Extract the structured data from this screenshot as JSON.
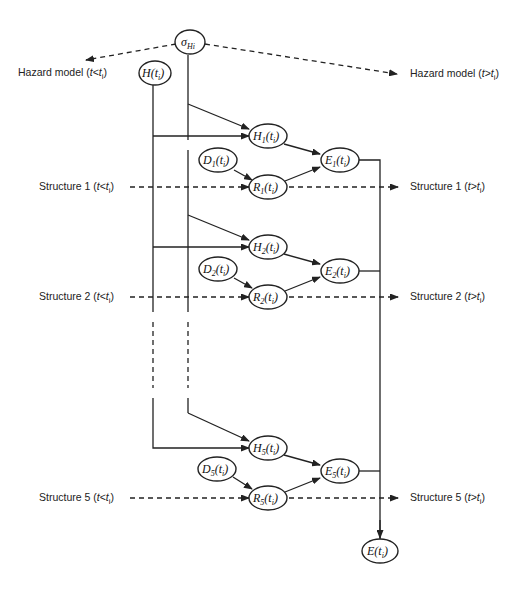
{
  "diagram": {
    "nodes": {
      "sigma": {
        "base": "σ",
        "sub": "Hi",
        "suffix": ""
      },
      "H": {
        "base": "H(t",
        "sub": "i",
        "suffix": ")"
      },
      "H1": {
        "base": "H",
        "sub": "1",
        "suffix": "(t",
        "sub2": "i",
        "suffix2": ")"
      },
      "D1": {
        "base": "D",
        "sub": "1",
        "suffix": "(t",
        "sub2": "i",
        "suffix2": ")"
      },
      "R1": {
        "base": "R",
        "sub": "1",
        "suffix": "(t",
        "sub2": "i",
        "suffix2": ")"
      },
      "E1": {
        "base": "E",
        "sub": "1",
        "suffix": "(t",
        "sub2": "i",
        "suffix2": ")"
      },
      "H2": {
        "base": "H",
        "sub": "2",
        "suffix": "(t",
        "sub2": "i",
        "suffix2": ")"
      },
      "D2": {
        "base": "D",
        "sub": "2",
        "suffix": "(t",
        "sub2": "i",
        "suffix2": ")"
      },
      "R2": {
        "base": "R",
        "sub": "2",
        "suffix": "(t",
        "sub2": "i",
        "suffix2": ")"
      },
      "E2": {
        "base": "E",
        "sub": "2",
        "suffix": "(t",
        "sub2": "i",
        "suffix2": ")"
      },
      "H5": {
        "base": "H",
        "sub": "5",
        "suffix": "(t",
        "sub2": "i",
        "suffix2": ")"
      },
      "D5": {
        "base": "D",
        "sub": "5",
        "suffix": "(t",
        "sub2": "i",
        "suffix2": ")"
      },
      "R5": {
        "base": "R",
        "sub": "5",
        "suffix": "(t",
        "sub2": "i",
        "suffix2": ")"
      },
      "E5": {
        "base": "E",
        "sub": "5",
        "suffix": "(t",
        "sub2": "i",
        "suffix2": ")"
      },
      "E": {
        "base": "E(t",
        "sub": "i",
        "suffix": ")"
      }
    },
    "labels": {
      "hazard_before": {
        "text": "Hazard model (",
        "var": "t",
        "op": "<",
        "var2": "t",
        "sub": "i",
        "close": ")"
      },
      "hazard_after": {
        "text": "Hazard model (",
        "var": "t",
        "op": ">",
        "var2": "t",
        "sub": "i",
        "close": ")"
      },
      "s1_before": {
        "text": "Structure 1 (",
        "var": "t",
        "op": "<",
        "var2": "t",
        "sub": "i",
        "close": ")"
      },
      "s1_after": {
        "text": "Structure 1 (",
        "var": "t",
        "op": ">",
        "var2": "t",
        "sub": "i",
        "close": ")"
      },
      "s2_before": {
        "text": "Structure 2 (",
        "var": "t",
        "op": "<",
        "var2": "t",
        "sub": "i",
        "close": ")"
      },
      "s2_after": {
        "text": "Structure 2 (",
        "var": "t",
        "op": ">",
        "var2": "t",
        "sub": "i",
        "close": ")"
      },
      "s5_before": {
        "text": "Structure 5 (",
        "var": "t",
        "op": "<",
        "var2": "t",
        "sub": "i",
        "close": ")"
      },
      "s5_after": {
        "text": "Structure 5 (",
        "var": "t",
        "op": ">",
        "var2": "t",
        "sub": "i",
        "close": ")"
      }
    }
  }
}
